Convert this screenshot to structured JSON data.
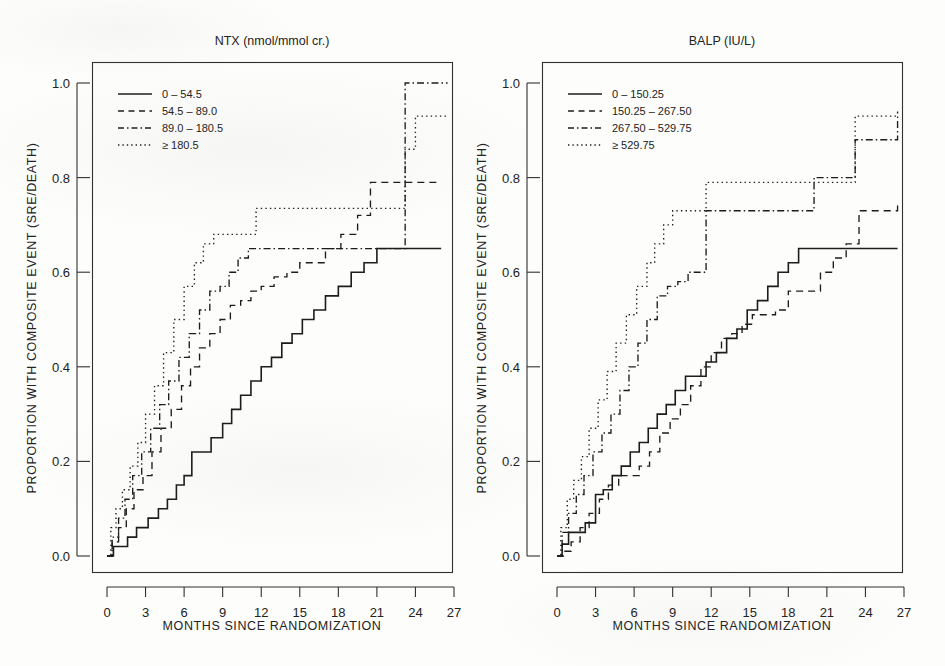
{
  "figure": {
    "background_color": "#fdfdfc",
    "ink_color": "#1c1c1c",
    "axis_title_x": "MONTHS SINCE RANDOMIZATION",
    "axis_title_y": "PROPORTION WITH COMPOSITE EVENT (SRE/DEATH)"
  },
  "chart_data": [
    {
      "type": "line",
      "panel": "left",
      "title": "NTX (nmol/mmol cr.)",
      "xlabel": "MONTHS SINCE RANDOMIZATION",
      "ylabel": "PROPORTION WITH COMPOSITE EVENT (SRE/DEATH)",
      "xlim": [
        -0.8,
        28.5
      ],
      "ylim": [
        -0.04,
        1.06
      ],
      "xticks": [
        0,
        3,
        6,
        9,
        12,
        15,
        18,
        21,
        24,
        27
      ],
      "xtick_labels": [
        "0",
        "3",
        "6",
        "9",
        "12",
        "15",
        "18",
        "21",
        "24",
        "27"
      ],
      "yticks": [
        0.0,
        0.2,
        0.4,
        0.6,
        0.8,
        1.0
      ],
      "ytick_labels": [
        "0.0",
        "0.2",
        "0.4",
        "0.6",
        "0.8",
        "1.0"
      ],
      "grid": false,
      "legend_position": "top-left",
      "step": "post",
      "series": [
        {
          "name": "0 – 54.5",
          "style": "solid",
          "x": [
            0.0,
            0.5,
            1.0,
            1.6,
            2.3,
            3.2,
            4.0,
            4.7,
            5.4,
            6.0,
            6.6,
            7.3,
            8.1,
            9.0,
            9.7,
            10.4,
            11.2,
            12.0,
            12.8,
            13.6,
            14.4,
            15.2,
            16.1,
            17.0,
            18.0,
            19.0,
            20.0,
            21.0,
            26.0
          ],
          "y": [
            0.0,
            0.02,
            0.02,
            0.04,
            0.06,
            0.08,
            0.1,
            0.12,
            0.15,
            0.17,
            0.22,
            0.22,
            0.25,
            0.28,
            0.31,
            0.34,
            0.37,
            0.4,
            0.42,
            0.45,
            0.47,
            0.5,
            0.52,
            0.55,
            0.57,
            0.6,
            0.62,
            0.65,
            0.65
          ]
        },
        {
          "name": "54.5 – 89.0",
          "style": "dashed",
          "x": [
            0.0,
            0.4,
            0.9,
            1.5,
            2.1,
            2.8,
            3.5,
            4.2,
            5.0,
            5.8,
            6.5,
            7.2,
            8.0,
            8.8,
            9.6,
            10.4,
            11.2,
            12.0,
            13.0,
            14.0,
            15.0,
            16.0,
            17.0,
            18.2,
            19.5,
            20.5,
            26.0
          ],
          "y": [
            0.0,
            0.03,
            0.06,
            0.1,
            0.14,
            0.17,
            0.22,
            0.27,
            0.31,
            0.36,
            0.4,
            0.44,
            0.47,
            0.5,
            0.53,
            0.54,
            0.56,
            0.57,
            0.59,
            0.6,
            0.62,
            0.62,
            0.65,
            0.68,
            0.72,
            0.79,
            0.79
          ]
        },
        {
          "name": "89.0 – 180.5",
          "style": "dotdash",
          "x": [
            0.0,
            0.4,
            0.9,
            1.4,
            2.0,
            2.7,
            3.4,
            4.1,
            4.8,
            5.6,
            6.4,
            7.2,
            8.0,
            8.8,
            9.5,
            10.2,
            11.0,
            22.8,
            23.2,
            26.5
          ],
          "y": [
            0.0,
            0.04,
            0.08,
            0.12,
            0.17,
            0.22,
            0.27,
            0.32,
            0.37,
            0.42,
            0.47,
            0.52,
            0.56,
            0.57,
            0.6,
            0.63,
            0.65,
            0.65,
            1.0,
            1.0
          ]
        },
        {
          "name": "≥ 180.5",
          "style": "dotted",
          "x": [
            0.0,
            0.3,
            0.7,
            1.2,
            1.8,
            2.4,
            3.0,
            3.7,
            4.4,
            5.2,
            6.0,
            6.8,
            7.5,
            8.3,
            9.0,
            11.0,
            11.6,
            22.5,
            23.2,
            24.0,
            26.5
          ],
          "y": [
            0.0,
            0.06,
            0.1,
            0.14,
            0.19,
            0.24,
            0.3,
            0.36,
            0.43,
            0.5,
            0.57,
            0.62,
            0.66,
            0.68,
            0.68,
            0.68,
            0.735,
            0.735,
            0.86,
            0.93,
            0.93
          ]
        }
      ]
    },
    {
      "type": "line",
      "panel": "right",
      "title": "BALP (IU/L)",
      "xlabel": "MONTHS SINCE RANDOMIZATION",
      "ylabel": "PROPORTION WITH COMPOSITE EVENT (SRE/DEATH)",
      "xlim": [
        -0.8,
        28.5
      ],
      "ylim": [
        -0.04,
        1.06
      ],
      "xticks": [
        0,
        3,
        6,
        9,
        12,
        15,
        18,
        21,
        24,
        27
      ],
      "xtick_labels": [
        "0",
        "3",
        "6",
        "9",
        "12",
        "15",
        "18",
        "21",
        "24",
        "27"
      ],
      "yticks": [
        0.0,
        0.2,
        0.4,
        0.6,
        0.8,
        1.0
      ],
      "ytick_labels": [
        "0.0",
        "0.2",
        "0.4",
        "0.6",
        "0.8",
        "1.0"
      ],
      "grid": false,
      "legend_position": "top-left",
      "step": "post",
      "series": [
        {
          "name": "0 – 150.25",
          "style": "solid",
          "x": [
            0.0,
            0.4,
            0.9,
            1.5,
            2.2,
            3.0,
            3.6,
            4.3,
            5.0,
            5.7,
            6.4,
            7.1,
            7.8,
            8.5,
            9.2,
            10.0,
            10.8,
            11.6,
            12.4,
            13.2,
            14.0,
            14.8,
            15.6,
            16.4,
            17.2,
            18.0,
            18.8,
            26.5
          ],
          "y": [
            0.0,
            0.025,
            0.05,
            0.05,
            0.07,
            0.13,
            0.14,
            0.17,
            0.19,
            0.22,
            0.24,
            0.27,
            0.3,
            0.32,
            0.35,
            0.38,
            0.38,
            0.41,
            0.43,
            0.46,
            0.48,
            0.52,
            0.54,
            0.57,
            0.6,
            0.62,
            0.65,
            0.65
          ]
        },
        {
          "name": "150.25 – 267.50",
          "style": "dashed",
          "x": [
            0.0,
            0.5,
            1.1,
            1.8,
            2.5,
            3.3,
            4.0,
            4.8,
            5.6,
            6.4,
            7.2,
            8.0,
            8.8,
            9.6,
            10.4,
            11.2,
            12.0,
            12.8,
            13.6,
            14.4,
            15.2,
            16.0,
            17.0,
            18.0,
            20.5,
            21.5,
            22.5,
            23.5,
            26.5
          ],
          "y": [
            0.0,
            0.01,
            0.03,
            0.06,
            0.09,
            0.12,
            0.15,
            0.17,
            0.17,
            0.19,
            0.22,
            0.26,
            0.29,
            0.32,
            0.36,
            0.4,
            0.43,
            0.46,
            0.47,
            0.49,
            0.51,
            0.51,
            0.52,
            0.56,
            0.6,
            0.63,
            0.66,
            0.73,
            0.75
          ]
        },
        {
          "name": "267.50 – 529.75",
          "style": "dotdash",
          "x": [
            0.0,
            0.4,
            0.9,
            1.5,
            2.1,
            2.8,
            3.5,
            4.2,
            4.9,
            5.6,
            6.3,
            7.0,
            7.8,
            8.6,
            9.4,
            10.2,
            11.0,
            11.6,
            19.0,
            20.0,
            22.5,
            23.2,
            26.5
          ],
          "y": [
            0.0,
            0.05,
            0.09,
            0.13,
            0.17,
            0.22,
            0.26,
            0.3,
            0.35,
            0.4,
            0.45,
            0.5,
            0.55,
            0.57,
            0.58,
            0.6,
            0.6,
            0.73,
            0.73,
            0.8,
            0.8,
            0.88,
            0.94
          ]
        },
        {
          "name": "≥ 529.75",
          "style": "dotted",
          "x": [
            0.0,
            0.3,
            0.8,
            1.3,
            1.9,
            2.5,
            3.2,
            3.9,
            4.6,
            5.4,
            6.2,
            7.0,
            7.6,
            8.3,
            9.0,
            9.8,
            11.0,
            11.6,
            22.5,
            23.2,
            26.5
          ],
          "y": [
            0.0,
            0.06,
            0.12,
            0.16,
            0.21,
            0.27,
            0.33,
            0.39,
            0.45,
            0.51,
            0.57,
            0.62,
            0.66,
            0.7,
            0.73,
            0.73,
            0.73,
            0.79,
            0.79,
            0.93,
            0.93
          ]
        }
      ]
    }
  ]
}
